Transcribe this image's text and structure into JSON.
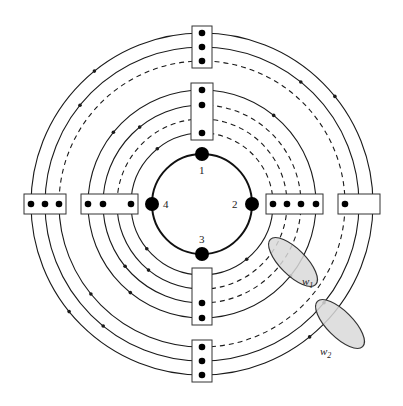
{
  "diagram": {
    "center": [
      202,
      204
    ],
    "core_radius": 50,
    "nodes": [
      {
        "id": "1",
        "label": "1",
        "angle": 90
      },
      {
        "id": "2",
        "label": "2",
        "angle": 0
      },
      {
        "id": "3",
        "label": "3",
        "angle": 270
      },
      {
        "id": "4",
        "label": "4",
        "angle": 180
      }
    ],
    "rings": [
      {
        "r": 171,
        "dash": [
          "solid",
          "solid",
          "solid",
          "solid"
        ]
      },
      {
        "r": 157,
        "dash": [
          "solid",
          "solid",
          "solid",
          "solid"
        ]
      },
      {
        "r": 143,
        "dash": [
          "dashed",
          "dashed",
          "solid",
          "dashed"
        ]
      },
      {
        "r": 114,
        "dash": [
          "solid",
          "solid",
          "solid",
          "solid"
        ]
      },
      {
        "r": 99,
        "dash": [
          "dashed",
          "solid",
          "solid",
          "dashed"
        ]
      },
      {
        "r": 85,
        "dash": [
          "dashed",
          "dashed",
          "solid",
          "dashed"
        ]
      },
      {
        "r": 71,
        "dash": [
          "dashed",
          "solid",
          "solid",
          "solid"
        ]
      }
    ],
    "ellipses": [
      {
        "label": "w1",
        "label_main": "w",
        "label_sub": "1"
      },
      {
        "label": "w2",
        "label_main": "w",
        "label_sub": "2"
      }
    ],
    "colors": {
      "line": "#1a1a1a",
      "ellipse_fill": "#d9d9d9"
    }
  }
}
